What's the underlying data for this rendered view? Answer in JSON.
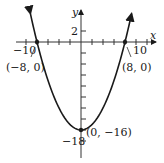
{
  "chart_data": {
    "type": "line",
    "title": "",
    "xlabel": "x",
    "ylabel": "y",
    "function": "y = x^2/4 - 16",
    "x_tick_labels": [
      "-10",
      "10"
    ],
    "y_tick_labels": [
      "2",
      "-18"
    ],
    "x_tick_step": 2,
    "y_tick_step": 2,
    "xlim": [
      -11.5,
      13
    ],
    "ylim": [
      -20,
      5.5
    ],
    "grid": false,
    "series": [
      {
        "name": "parabola",
        "x": [
          -9.2,
          -8,
          -6,
          -4,
          -2,
          0,
          2,
          4,
          6,
          8,
          9.2
        ],
        "y": [
          5.16,
          0,
          -7,
          -12,
          -15,
          -16,
          -15,
          -12,
          -7,
          0,
          5.16
        ]
      }
    ],
    "annotations": [
      {
        "label": "(-8, 0)",
        "x": -8,
        "y": 0
      },
      {
        "label": "(8, 0)",
        "x": 8,
        "y": 0
      },
      {
        "label": "(0, -16)",
        "x": 0,
        "y": -16
      }
    ]
  },
  "labels": {
    "x_axis": "x",
    "y_axis": "y",
    "tick_neg10": "−10",
    "tick_10": "10",
    "tick_2": "2",
    "tick_neg18": "−18",
    "pt_left": "(−8, 0)",
    "pt_right": "(8, 0)",
    "pt_vertex": "(0, −16)"
  },
  "colors": {
    "curve": "#1a1a1a",
    "axis": "#333333"
  }
}
